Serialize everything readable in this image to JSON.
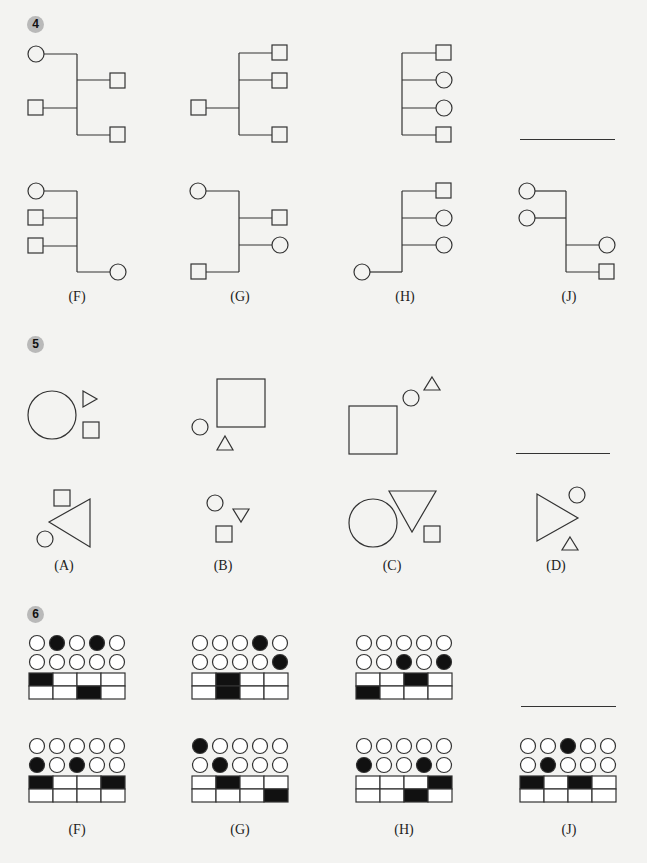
{
  "questions": [
    {
      "number": "4",
      "type": "tree-diagram-analogy",
      "options": [
        {
          "label": "(F)"
        },
        {
          "label": "(G)"
        },
        {
          "label": "(H)"
        },
        {
          "label": "(J)"
        }
      ]
    },
    {
      "number": "5",
      "type": "shape-analogy",
      "options": [
        {
          "label": "(A)"
        },
        {
          "label": "(B)"
        },
        {
          "label": "(C)"
        },
        {
          "label": "(D)"
        }
      ]
    },
    {
      "number": "6",
      "type": "dot-grid-analogy",
      "stem": [
        {
          "circles_row1": [
            0,
            1,
            0,
            1,
            0
          ],
          "circles_row2": [
            0,
            0,
            0,
            0,
            0
          ],
          "grid_row1": [
            1,
            0,
            0,
            0
          ],
          "grid_row2": [
            0,
            0,
            1,
            0
          ]
        },
        {
          "circles_row1": [
            0,
            0,
            0,
            1,
            0
          ],
          "circles_row2": [
            0,
            0,
            0,
            0,
            1
          ],
          "grid_row1": [
            0,
            1,
            0,
            0
          ],
          "grid_row2": [
            0,
            1,
            0,
            0
          ]
        },
        {
          "circles_row1": [
            0,
            0,
            0,
            0,
            0
          ],
          "circles_row2": [
            0,
            0,
            1,
            0,
            1
          ],
          "grid_row1": [
            0,
            0,
            1,
            0
          ],
          "grid_row2": [
            1,
            0,
            0,
            0
          ]
        }
      ],
      "options": [
        {
          "label": "(F)",
          "circles_row1": [
            0,
            0,
            0,
            0,
            0
          ],
          "circles_row2": [
            1,
            0,
            1,
            0,
            0
          ],
          "grid_row1": [
            1,
            0,
            0,
            1
          ],
          "grid_row2": [
            0,
            0,
            0,
            0
          ]
        },
        {
          "label": "(G)",
          "circles_row1": [
            1,
            0,
            0,
            0,
            0
          ],
          "circles_row2": [
            0,
            1,
            0,
            0,
            0
          ],
          "grid_row1": [
            0,
            1,
            0,
            0
          ],
          "grid_row2": [
            0,
            0,
            0,
            1
          ]
        },
        {
          "label": "(H)",
          "circles_row1": [
            0,
            0,
            0,
            0,
            0
          ],
          "circles_row2": [
            1,
            0,
            0,
            1,
            0
          ],
          "grid_row1": [
            0,
            0,
            0,
            1
          ],
          "grid_row2": [
            0,
            0,
            1,
            0
          ]
        },
        {
          "label": "(J)",
          "circles_row1": [
            0,
            0,
            1,
            0,
            0
          ],
          "circles_row2": [
            0,
            1,
            0,
            0,
            0
          ],
          "grid_row1": [
            1,
            0,
            1,
            0
          ],
          "grid_row2": [
            0,
            0,
            0,
            0
          ]
        }
      ]
    }
  ]
}
